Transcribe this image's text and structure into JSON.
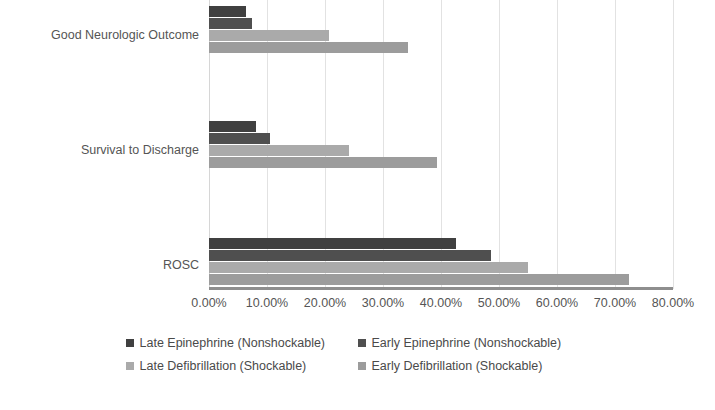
{
  "chart_data": {
    "type": "bar",
    "orientation": "horizontal",
    "title": "",
    "subtitle": "",
    "xlabel": "",
    "ylabel": "",
    "xlim": [
      0,
      80
    ],
    "xtick_values": [
      0,
      10,
      20,
      30,
      40,
      50,
      60,
      70,
      80
    ],
    "xtick_labels": [
      "0.00%",
      "10.00%",
      "20.00%",
      "30.00%",
      "40.00%",
      "50.00%",
      "60.00%",
      "70.00%",
      "80.00%"
    ],
    "grid": true,
    "grid_axis": "x",
    "legend_position": "bottom",
    "categories": [
      "ROSC",
      "Survival to Discharge",
      "Good Neurologic Outcome"
    ],
    "series": [
      {
        "name": "Late Epinephrine (Nonshockable)",
        "color": "#404040",
        "values": [
          42.6,
          8.1,
          6.4
        ]
      },
      {
        "name": "Early Epinephrine (Nonshockable)",
        "color": "#4f4f4f",
        "values": [
          48.6,
          10.5,
          7.4
        ]
      },
      {
        "name": "Late Defibrillation (Shockable)",
        "color": "#aaaaaa",
        "values": [
          55.0,
          24.1,
          20.7
        ]
      },
      {
        "name": "Early Defibrillation (Shockable)",
        "color": "#9c9c9c",
        "values": [
          72.4,
          39.3,
          34.3
        ]
      }
    ]
  },
  "axis": {
    "ticks": [
      {
        "label": "0.00%",
        "value": 0
      },
      {
        "label": "10.00%",
        "value": 10
      },
      {
        "label": "20.00%",
        "value": 20
      },
      {
        "label": "30.00%",
        "value": 30
      },
      {
        "label": "40.00%",
        "value": 40
      },
      {
        "label": "50.00%",
        "value": 50
      },
      {
        "label": "60.00%",
        "value": 60
      },
      {
        "label": "70.00%",
        "value": 70
      },
      {
        "label": "80.00%",
        "value": 80
      }
    ]
  },
  "categories": [
    {
      "label": "Good Neurologic Outcome"
    },
    {
      "label": "Survival to Discharge"
    },
    {
      "label": "ROSC"
    }
  ],
  "legend": {
    "rows": [
      [
        {
          "label": "Late Epinephrine (Nonshockable)",
          "color": "#404040"
        },
        {
          "label": "Early Epinephrine (Nonshockable)",
          "color": "#4f4f4f"
        }
      ],
      [
        {
          "label": "Late Defibrillation (Shockable)",
          "color": "#aaaaaa"
        },
        {
          "label": "Early Defibrillation (Shockable)",
          "color": "#9c9c9c"
        }
      ]
    ]
  },
  "colors": {
    "gridline": "#e2e2e2",
    "axis": "#8e8e8e",
    "text": "#555555",
    "background": "#ffffff"
  }
}
